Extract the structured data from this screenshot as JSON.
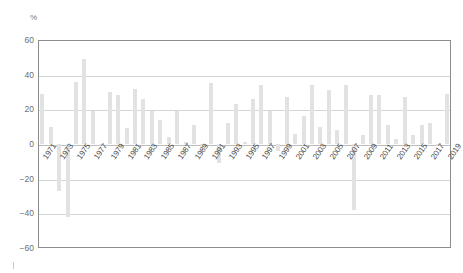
{
  "chart_data": {
    "type": "bar",
    "title": "",
    "subtitle": "",
    "xlabel": "",
    "ylabel": "",
    "unit_label": "%",
    "ylim": [
      -60,
      60
    ],
    "yticks": [
      60,
      40,
      20,
      0,
      -20,
      -40,
      -60
    ],
    "ytick_labels": [
      "60",
      "40",
      "20",
      "0",
      "−20",
      "−40",
      "−60"
    ],
    "grid": true,
    "grid_axis": "y",
    "legend": false,
    "legend_position": "none",
    "bar_color": "#e2e2e2",
    "axis_color": "#8c8c8c",
    "grid_color": "#d6d6d6",
    "tick_label_rotation": -55,
    "xtick_step": 2,
    "xtick_labels": [
      "1971",
      "1973",
      "1975",
      "1977",
      "1979",
      "1981",
      "1983",
      "1985",
      "1987",
      "1989",
      "1991",
      "1993",
      "1995",
      "1997",
      "1999",
      "2001",
      "2003",
      "2005",
      "2007",
      "2009",
      "2011",
      "2013",
      "2015",
      "2017",
      "2019"
    ],
    "categories": [
      "1971",
      "1972",
      "1973",
      "1974",
      "1975",
      "1976",
      "1977",
      "1978",
      "1979",
      "1980",
      "1981",
      "1982",
      "1983",
      "1984",
      "1985",
      "1986",
      "1987",
      "1988",
      "1989",
      "1990",
      "1991",
      "1992",
      "1993",
      "1994",
      "1995",
      "1996",
      "1997",
      "1998",
      "1999",
      "2000",
      "2001",
      "2002",
      "2003",
      "2004",
      "2005",
      "2006",
      "2007",
      "2008",
      "2009",
      "2010",
      "2011",
      "2012",
      "2013",
      "2014",
      "2015",
      "2016",
      "2017",
      "2018",
      "2019"
    ],
    "values": [
      29,
      10,
      -27,
      -42,
      36,
      49,
      19,
      -1,
      30,
      28,
      9,
      32,
      26,
      19,
      14,
      4,
      19,
      1,
      11,
      -2,
      35,
      -11,
      12,
      23,
      1,
      26,
      34,
      19,
      -4,
      27,
      6,
      16,
      34,
      10,
      31,
      8,
      34,
      -38,
      5,
      28,
      28,
      11,
      3,
      27,
      5,
      11,
      12,
      -1,
      29
    ]
  },
  "colors": {
    "bar": "#e2e2e2",
    "axis": "#8c8c8c",
    "grid": "#d6d6d6",
    "zero_line": "#bdbdbd",
    "tick_text": "#6f6f6f",
    "xtick_text": "#4a4a4a"
  }
}
